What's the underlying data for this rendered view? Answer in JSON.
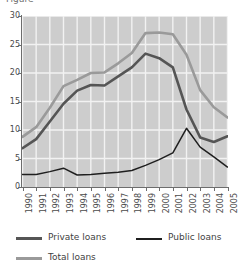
{
  "title_fragment": "Figure",
  "axis": {
    "y_ticks": [
      0,
      5,
      10,
      15,
      20,
      25,
      30
    ],
    "x_ticks": [
      "1990",
      "1991",
      "1992",
      "1993",
      "1994",
      "1995",
      "1996",
      "1997",
      "1998",
      "1999",
      "2000",
      "2001",
      "2002",
      "2003",
      "2004",
      "2005"
    ]
  },
  "legend": {
    "entries": [
      {
        "label": "Private loans",
        "color": "#555555"
      },
      {
        "label": "Public loans",
        "color": "#1f1f1f"
      },
      {
        "label": "Total loans",
        "color": "#9a9a9a"
      }
    ]
  },
  "style": {
    "plot_background": "#cdcdcd",
    "gridline_color": "#f2f2f2",
    "axis_color": "#6d6d6d",
    "text_color": "#4a4a4a"
  },
  "chart_data": {
    "type": "line",
    "title": "",
    "xlabel": "",
    "ylabel": "",
    "xlim": [
      1990,
      2005
    ],
    "ylim": [
      0,
      30
    ],
    "grid": true,
    "legend_position": "bottom",
    "x": [
      1990,
      1991,
      1992,
      1993,
      1994,
      1995,
      1996,
      1997,
      1998,
      1999,
      2000,
      2001,
      2002,
      2003,
      2004,
      2005
    ],
    "series": [
      {
        "name": "Private loans",
        "color": "#555555",
        "values": [
          6.8,
          8.4,
          11.5,
          14.6,
          16.9,
          17.9,
          17.8,
          19.4,
          21.0,
          23.4,
          22.6,
          21.0,
          13.6,
          8.7,
          7.9,
          8.9
        ]
      },
      {
        "name": "Public loans",
        "color": "#1f1f1f",
        "values": [
          2.2,
          2.2,
          2.7,
          3.3,
          2.1,
          2.2,
          2.4,
          2.6,
          2.9,
          3.8,
          4.8,
          6.0,
          10.3,
          7.0,
          5.3,
          3.5
        ]
      },
      {
        "name": "Total loans",
        "color": "#9a9a9a",
        "values": [
          8.8,
          10.5,
          13.9,
          17.7,
          18.8,
          20.0,
          20.1,
          21.7,
          23.5,
          27.0,
          27.1,
          26.8,
          23.2,
          17.0,
          14.0,
          12.2
        ]
      }
    ]
  }
}
